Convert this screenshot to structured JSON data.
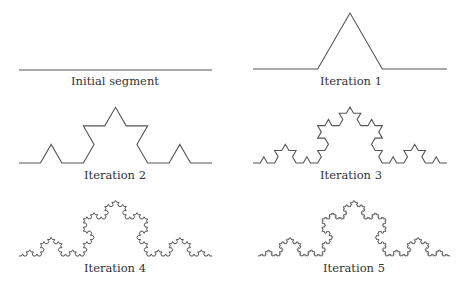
{
  "figure": {
    "stroke_color": "#555555",
    "panels": [
      {
        "id": "initial",
        "label": "Initial segment",
        "iteration": 0,
        "x0": 19,
        "x1": 212,
        "baseline_y": 70,
        "label_x": 115,
        "label_y": 76
      },
      {
        "id": "iter1",
        "label": "Iteration 1",
        "iteration": 1,
        "x0": 253,
        "x1": 447,
        "baseline_y": 69,
        "label_x": 351,
        "label_y": 76
      },
      {
        "id": "iter2",
        "label": "Iteration 2",
        "iteration": 2,
        "x0": 19,
        "x1": 212,
        "baseline_y": 163,
        "label_x": 115,
        "label_y": 170
      },
      {
        "id": "iter3",
        "label": "Iteration 3",
        "iteration": 3,
        "x0": 253,
        "x1": 447,
        "baseline_y": 163,
        "label_x": 351,
        "label_y": 170
      },
      {
        "id": "iter4",
        "label": "Iteration 4",
        "iteration": 4,
        "x0": 19,
        "x1": 212,
        "baseline_y": 256,
        "label_x": 115,
        "label_y": 263
      },
      {
        "id": "iter5",
        "label": "Iteration 5",
        "iteration": 5,
        "x0": 258,
        "x1": 450,
        "baseline_y": 256,
        "label_x": 354,
        "label_y": 263
      }
    ]
  }
}
